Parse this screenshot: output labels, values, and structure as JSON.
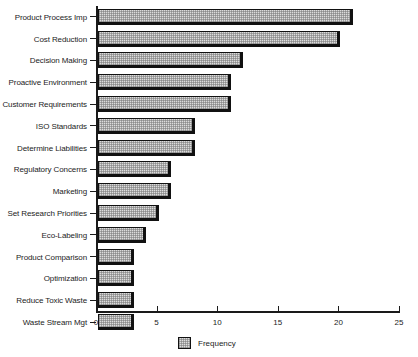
{
  "chart_data": {
    "type": "bar",
    "orientation": "horizontal",
    "title": "",
    "xlabel": "",
    "ylabel": "",
    "xlim": [
      0,
      25
    ],
    "xticks": [
      0,
      5,
      10,
      15,
      20,
      25
    ],
    "xtick_labels": [
      "0",
      "5",
      "10",
      "15",
      "20",
      "25"
    ],
    "grid": false,
    "legend_position": "bottom-center",
    "legend": [
      "Frequency"
    ],
    "series": [
      {
        "name": "Frequency",
        "values": [
          21,
          20,
          12,
          11,
          11,
          8,
          8,
          6,
          6,
          5,
          4,
          3,
          3,
          3,
          3
        ]
      }
    ],
    "categories": [
      "Product Process Imp",
      "Cost Reduction",
      "Decision Making",
      "Proactive Environment",
      "Customer Requirements",
      "ISO Standards",
      "Determine Liabilities",
      "Regulatory Concerns",
      "Marketing",
      "Set Research Priorities",
      "Eco-Labeling",
      "Product Comparison",
      "Optimization",
      "Reduce Toxic Waste",
      "Waste Stream Mgt"
    ],
    "bars": [
      {
        "category": "Product Process Imp",
        "value": 21
      },
      {
        "category": "Cost Reduction",
        "value": 20
      },
      {
        "category": "Decision Making",
        "value": 12
      },
      {
        "category": "Proactive Environment",
        "value": 11
      },
      {
        "category": "Customer Requirements",
        "value": 11
      },
      {
        "category": "ISO Standards",
        "value": 8
      },
      {
        "category": "Determine Liabilities",
        "value": 8
      },
      {
        "category": "Regulatory Concerns",
        "value": 6
      },
      {
        "category": "Marketing",
        "value": 6
      },
      {
        "category": "Set Research Priorities",
        "value": 5
      },
      {
        "category": "Eco-Labeling",
        "value": 4
      },
      {
        "category": "Product Comparison",
        "value": 3
      },
      {
        "category": "Optimization",
        "value": 3
      },
      {
        "category": "Reduce Toxic Waste",
        "value": 3
      },
      {
        "category": "Waste Stream Mgt",
        "value": 3
      }
    ],
    "colors": {
      "bar_fill": "#dcdcdc",
      "bar_outline": "#111111",
      "axis": "#1a1a1a",
      "text": "#1c1c1c",
      "background": "#ffffff"
    }
  }
}
